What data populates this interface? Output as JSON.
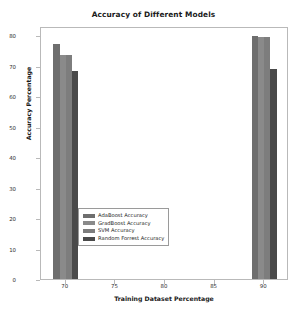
{
  "chart_data": {
    "type": "bar",
    "title": "Accuracy of Different Models",
    "xlabel": "Training Dataset Percentage",
    "ylabel": "Accuracy Percentage",
    "categories": [
      "70",
      "90"
    ],
    "xticks": [
      "70",
      "75",
      "80",
      "85",
      "90"
    ],
    "yticks": [
      "0",
      "10",
      "20",
      "30",
      "40",
      "50",
      "60",
      "70",
      "80"
    ],
    "xlim": [
      67.5,
      92.5
    ],
    "ylim": [
      0,
      83
    ],
    "grid": false,
    "legend_position": "lower center",
    "series": [
      {
        "name": "AdaBoost Accuracy",
        "color": "#6e6e6e",
        "values": [
          77.0,
          79.6
        ]
      },
      {
        "name": "GradBoost Accuracy",
        "color": "#8a8a8a",
        "values": [
          73.5,
          79.5
        ]
      },
      {
        "name": "SVM Accuracy",
        "color": "#7d7d7d",
        "values": [
          73.5,
          79.5
        ]
      },
      {
        "name": "Random Forrest Accuracy",
        "color": "#4a4a4a",
        "values": [
          68.2,
          69.0
        ]
      }
    ]
  },
  "legend": {
    "entries": [
      "AdaBoost Accuracy",
      "GradBoost Accuracy",
      "SVM Accuracy",
      "Random Forrest Accuracy"
    ]
  }
}
